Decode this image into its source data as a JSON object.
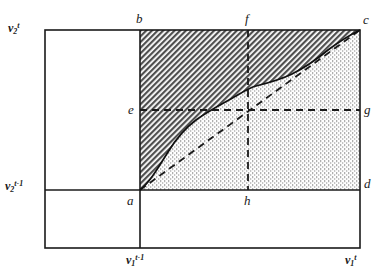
{
  "figure": {
    "title": "",
    "type": "diagram",
    "background": "#ffffff",
    "line_color": "#1a1a1a",
    "hatch_color": "#5a5a5a",
    "dot_color": "#9a9a9a"
  },
  "axis_labels": {
    "y_top": {
      "base": "v",
      "sub": "2",
      "sup": "t"
    },
    "y_bottom": {
      "base": "v",
      "sub": "2",
      "sup": "t-1"
    },
    "x_left": {
      "base": "v",
      "sub": "1",
      "sup": "t-1"
    },
    "x_right": {
      "base": "v",
      "sub": "1",
      "sup": "t"
    }
  },
  "points": [
    {
      "id": "b",
      "label": "b",
      "x": 140,
      "y": 30
    },
    {
      "id": "f",
      "label": "f",
      "x": 248,
      "y": 30
    },
    {
      "id": "c",
      "label": "c",
      "x": 360,
      "y": 30
    },
    {
      "id": "e",
      "label": "e",
      "x": 140,
      "y": 110
    },
    {
      "id": "g",
      "label": "g",
      "x": 360,
      "y": 110
    },
    {
      "id": "a",
      "label": "a",
      "x": 140,
      "y": 190
    },
    {
      "id": "h",
      "label": "h",
      "x": 248,
      "y": 190
    },
    {
      "id": "d",
      "label": "d",
      "x": 360,
      "y": 190
    }
  ],
  "frame": {
    "x0": 45,
    "y0": 30,
    "x1": 360,
    "y1": 248
  },
  "grid_lines": {
    "vertical_solid_x": 140,
    "horizontal_solid_y": 190
  },
  "dashed_lines": [
    {
      "name": "diagonal-a-to-c",
      "from": "a",
      "to": "c"
    },
    {
      "name": "horizontal-e-to-g",
      "from": "e",
      "to": "g"
    },
    {
      "name": "vertical-f-to-h",
      "from": "f",
      "to": "h"
    }
  ],
  "curve": {
    "name": "reaction-curve",
    "from": "a",
    "to": "c",
    "path": "M140,190 C150,182 158,168 168,152 C176,139 184,129 196,120 C208,111 222,104 236,96 C243,92 249,88 256,86 C268,83 280,80 292,74 C304,68 316,60 328,50 C340,41 350,35 360,30"
  },
  "regions": [
    {
      "name": "upper-region",
      "fill": "hatch",
      "description": "area above curve, bounded by b-c top and a-b left"
    },
    {
      "name": "lower-region",
      "fill": "dots",
      "description": "area below curve, bounded by a-d bottom and c-d right"
    }
  ]
}
